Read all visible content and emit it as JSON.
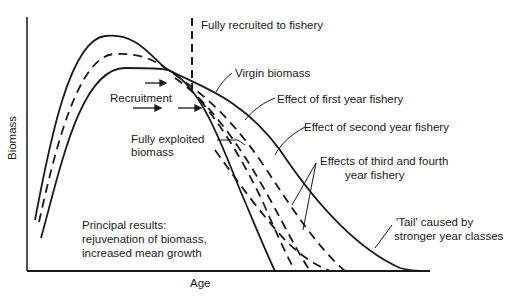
{
  "figure": {
    "axes": {
      "x_label": "Age",
      "y_label": "Biomass"
    },
    "labels": {
      "fully_recruited": "Fully recruited to fishery",
      "virgin_biomass": "Virgin biomass",
      "recruitment": "Recruitment",
      "first_year": "Effect of first year fishery",
      "second_year": "Effect of second year fishery",
      "third_fourth_line1": "Effects of third and fourth",
      "third_fourth_line2": "year fishery",
      "fully_exploited_line1": "Fully exploited",
      "fully_exploited_line2": "biomass",
      "tail_line1": "'Tail'  caused by",
      "tail_line2": "stronger year classes",
      "principal_line1": "Principal results:",
      "principal_line2": "rejuvenation of biomass,",
      "principal_line3": "increased mean growth"
    },
    "curves": [
      {
        "name": "Virgin biomass",
        "style": "solid"
      },
      {
        "name": "Effect of first year fishery",
        "style": "dashed"
      },
      {
        "name": "Effect of second year fishery",
        "style": "dashed"
      },
      {
        "name": "Effects of third and fourth year fishery",
        "style": "dashed"
      },
      {
        "name": "Fully exploited biomass",
        "style": "solid"
      }
    ],
    "line_color": "#1a1a1a",
    "background": "#ffffff"
  }
}
